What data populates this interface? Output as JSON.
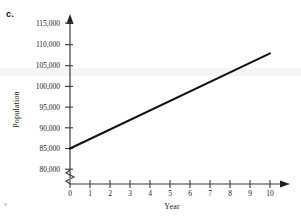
{
  "figure": {
    "part_label": "c."
  },
  "chart_data": {
    "type": "line",
    "title": "",
    "xlabel": "Year",
    "ylabel": "Population",
    "x": [
      0,
      1,
      2,
      3,
      4,
      5,
      6,
      7,
      8,
      9,
      10
    ],
    "values": [
      85000,
      87300,
      89600,
      91900,
      94200,
      96500,
      98800,
      101100,
      103400,
      105700,
      108000
    ],
    "series": [
      {
        "name": "Population",
        "values": [
          85000,
          87300,
          89600,
          91900,
          94200,
          96500,
          98800,
          101100,
          103400,
          105700,
          108000
        ],
        "color": "#111111"
      }
    ],
    "xlim": [
      0,
      10
    ],
    "ylim": [
      80000,
      115000
    ],
    "xticks": [
      "0",
      "1",
      "2",
      "3",
      "4",
      "5",
      "6",
      "7",
      "8",
      "9",
      "10"
    ],
    "yticks": [
      "80,000",
      "85,000",
      "90,000",
      "95,000",
      "100,000",
      "105,000",
      "110,000",
      "115,000"
    ],
    "ytick_values": [
      80000,
      85000,
      90000,
      95000,
      100000,
      105000,
      110000,
      115000
    ],
    "grid": false,
    "legend": false,
    "y_axis_break": true,
    "axis_arrows": true,
    "line_color": "#111111",
    "axis_color": "#444444"
  }
}
